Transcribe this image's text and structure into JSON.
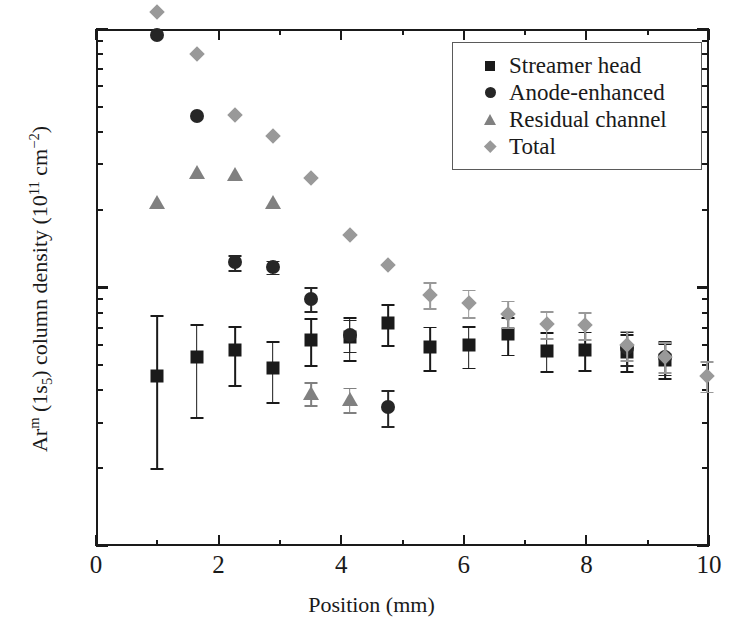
{
  "chart_data": {
    "type": "scatter",
    "title": "",
    "xlabel": "Position (mm)",
    "ylabel": "Ar^m (1s5) column density (10^11 cm^-2)",
    "ylabel_parts": {
      "prefix": "Ar",
      "sup1": "m",
      "mid": " (1s",
      "sub1": "5",
      "mid2": ") column density (10",
      "sup2": "11",
      "mid3": " cm",
      "sup3": "−2",
      "suffix": ")"
    },
    "yscale": "log",
    "xscale": "linear",
    "xlim": [
      0,
      10
    ],
    "ylim": [
      0.1,
      10
    ],
    "xticks": [
      0,
      2,
      4,
      6,
      8,
      10
    ],
    "xticklabels": [
      "0",
      "2",
      "4",
      "6",
      "8",
      "10"
    ],
    "x_minor_ticks": [
      1,
      3,
      5,
      7,
      9
    ],
    "yticks": [
      0.1,
      1,
      10
    ],
    "yticklabels": [
      "0.1",
      "1",
      "10"
    ],
    "grid": false,
    "legend_position": "upper right",
    "series": [
      {
        "name": "Streamer head",
        "marker": "square",
        "color": "#1a1a1a",
        "points": [
          {
            "x": 1.0,
            "y": 0.455,
            "yerr_lo": 0.255,
            "yerr_hi": 0.325
          },
          {
            "x": 1.64,
            "y": 0.54,
            "yerr_lo": 0.225,
            "yerr_hi": 0.18
          },
          {
            "x": 2.27,
            "y": 0.575,
            "yerr_lo": 0.155,
            "yerr_hi": 0.135
          },
          {
            "x": 2.88,
            "y": 0.49,
            "yerr_lo": 0.13,
            "yerr_hi": 0.13
          },
          {
            "x": 3.51,
            "y": 0.625,
            "yerr_lo": 0.125,
            "yerr_hi": 0.135
          },
          {
            "x": 4.14,
            "y": 0.645,
            "yerr_lo": 0.12,
            "yerr_hi": 0.125
          },
          {
            "x": 4.77,
            "y": 0.73,
            "yerr_lo": 0.13,
            "yerr_hi": 0.13
          },
          {
            "x": 5.45,
            "y": 0.59,
            "yerr_lo": 0.11,
            "yerr_hi": 0.115
          },
          {
            "x": 6.08,
            "y": 0.6,
            "yerr_lo": 0.11,
            "yerr_hi": 0.11
          },
          {
            "x": 6.72,
            "y": 0.66,
            "yerr_lo": 0.11,
            "yerr_hi": 0.11
          },
          {
            "x": 7.35,
            "y": 0.57,
            "yerr_lo": 0.095,
            "yerr_hi": 0.1
          },
          {
            "x": 7.98,
            "y": 0.575,
            "yerr_lo": 0.095,
            "yerr_hi": 0.1
          },
          {
            "x": 8.66,
            "y": 0.565,
            "yerr_lo": 0.09,
            "yerr_hi": 0.095
          },
          {
            "x": 9.29,
            "y": 0.525,
            "yerr_lo": 0.08,
            "yerr_hi": 0.085
          }
        ]
      },
      {
        "name": "Anode-enhanced",
        "marker": "circle",
        "color": "#262626",
        "points": [
          {
            "x": 1.0,
            "y": 9.5,
            "yerr_lo": 0.0,
            "yerr_hi": 0.0
          },
          {
            "x": 1.64,
            "y": 4.6,
            "yerr_lo": 0.0,
            "yerr_hi": 0.0
          },
          {
            "x": 2.27,
            "y": 1.25,
            "yerr_lo": 0.08,
            "yerr_hi": 0.08
          },
          {
            "x": 2.88,
            "y": 1.2,
            "yerr_lo": 0.07,
            "yerr_hi": 0.07
          },
          {
            "x": 3.51,
            "y": 0.905,
            "yerr_lo": 0.095,
            "yerr_hi": 0.1
          },
          {
            "x": 4.14,
            "y": 0.655,
            "yerr_lo": 0.09,
            "yerr_hi": 0.095
          },
          {
            "x": 4.77,
            "y": 0.345,
            "yerr_lo": 0.055,
            "yerr_hi": 0.055
          },
          {
            "x": 5.45,
            "y": 0.0,
            "yerr_lo": 0.0,
            "yerr_hi": 0.0
          },
          {
            "x": 8.66,
            "y": 0.585,
            "yerr_lo": 0.085,
            "yerr_hi": 0.09
          },
          {
            "x": 9.29,
            "y": 0.54,
            "yerr_lo": 0.08,
            "yerr_hi": 0.08
          }
        ]
      },
      {
        "name": "Residual channel",
        "marker": "triangle",
        "color": "#808080",
        "points": [
          {
            "x": 1.0,
            "y": 2.15,
            "yerr_lo": 0.0,
            "yerr_hi": 0.0
          },
          {
            "x": 1.64,
            "y": 2.8,
            "yerr_lo": 0.0,
            "yerr_hi": 0.0
          },
          {
            "x": 2.27,
            "y": 2.75,
            "yerr_lo": 0.0,
            "yerr_hi": 0.0
          },
          {
            "x": 2.88,
            "y": 2.15,
            "yerr_lo": 0.0,
            "yerr_hi": 0.0
          },
          {
            "x": 3.51,
            "y": 0.39,
            "yerr_lo": 0.04,
            "yerr_hi": 0.04
          },
          {
            "x": 4.14,
            "y": 0.37,
            "yerr_lo": 0.04,
            "yerr_hi": 0.04
          }
        ]
      },
      {
        "name": "Total",
        "marker": "diamond",
        "color": "#999999",
        "points": [
          {
            "x": 1.0,
            "y": 11.6,
            "yerr_lo": 0.0,
            "yerr_hi": 0.0
          },
          {
            "x": 1.64,
            "y": 8.0,
            "yerr_lo": 0.0,
            "yerr_hi": 0.0
          },
          {
            "x": 2.27,
            "y": 4.65,
            "yerr_lo": 0.0,
            "yerr_hi": 0.0
          },
          {
            "x": 2.88,
            "y": 3.85,
            "yerr_lo": 0.0,
            "yerr_hi": 0.0
          },
          {
            "x": 3.51,
            "y": 2.65,
            "yerr_lo": 0.0,
            "yerr_hi": 0.0
          },
          {
            "x": 4.14,
            "y": 1.6,
            "yerr_lo": 0.0,
            "yerr_hi": 0.0
          },
          {
            "x": 4.77,
            "y": 1.22,
            "yerr_lo": 0.0,
            "yerr_hi": 0.0
          },
          {
            "x": 5.45,
            "y": 0.935,
            "yerr_lo": 0.105,
            "yerr_hi": 0.115
          },
          {
            "x": 6.08,
            "y": 0.87,
            "yerr_lo": 0.1,
            "yerr_hi": 0.11
          },
          {
            "x": 6.72,
            "y": 0.79,
            "yerr_lo": 0.09,
            "yerr_hi": 0.1
          },
          {
            "x": 7.35,
            "y": 0.72,
            "yerr_lo": 0.085,
            "yerr_hi": 0.09
          },
          {
            "x": 7.98,
            "y": 0.715,
            "yerr_lo": 0.085,
            "yerr_hi": 0.09
          },
          {
            "x": 8.66,
            "y": 0.6,
            "yerr_lo": 0.075,
            "yerr_hi": 0.08
          },
          {
            "x": 9.29,
            "y": 0.54,
            "yerr_lo": 0.07,
            "yerr_hi": 0.075
          },
          {
            "x": 9.97,
            "y": 0.455,
            "yerr_lo": 0.06,
            "yerr_hi": 0.065
          }
        ]
      }
    ]
  },
  "legend": {
    "entries": [
      {
        "label": "Streamer head",
        "marker": "square",
        "color": "#1a1a1a"
      },
      {
        "label": "Anode-enhanced",
        "marker": "circle",
        "color": "#262626"
      },
      {
        "label": "Residual channel",
        "marker": "triangle",
        "color": "#808080"
      },
      {
        "label": "Total",
        "marker": "diamond",
        "color": "#999999"
      }
    ]
  },
  "style": {
    "axis_color": "#1a1a1a",
    "background": "#ffffff",
    "legend_border": "#5a5a5a"
  }
}
